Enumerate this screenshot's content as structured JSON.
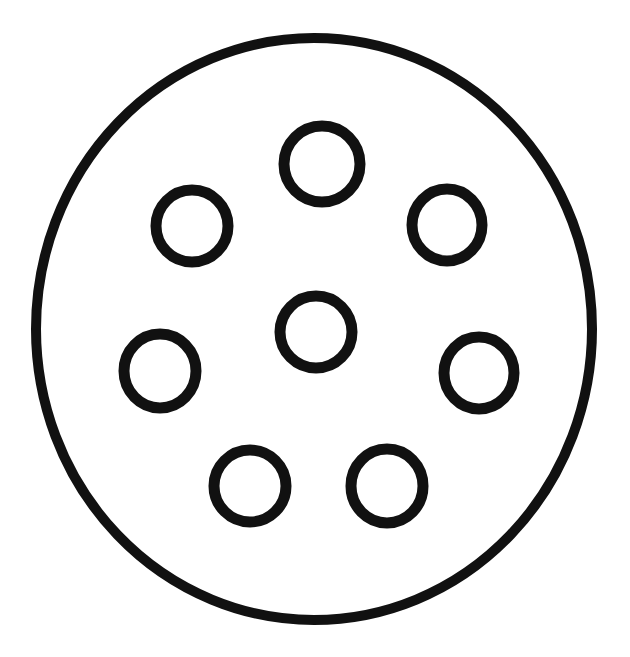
{
  "canvas": {
    "width": 630,
    "height": 657,
    "background_color": "#ffffff",
    "ink_color": "#111111"
  },
  "figure": {
    "name": "circular-plate-with-bolt-holes",
    "style": "hand-drawn ink outline, no fill, no labels, no dimensions, no text",
    "outer_boundary": {
      "name": "plate-outline",
      "shape": "circle",
      "center_x": 314,
      "center_y": 329,
      "radius_x": 278,
      "radius_y": 291,
      "stroke_width": 10,
      "fill": "none"
    },
    "holes": [
      {
        "name": "center-hole",
        "position": "center",
        "center_x": 316,
        "center_y": 332,
        "radius_x": 36,
        "radius_y": 36,
        "stroke_width": 11
      },
      {
        "name": "hole-top",
        "position": "top",
        "center_x": 322,
        "center_y": 164,
        "radius_x": 38,
        "radius_y": 38,
        "stroke_width": 11
      },
      {
        "name": "hole-upper-left",
        "position": "upper-left",
        "center_x": 192,
        "center_y": 226,
        "radius_x": 36,
        "radius_y": 36,
        "stroke_width": 11
      },
      {
        "name": "hole-upper-right",
        "position": "upper-right",
        "center_x": 447,
        "center_y": 225,
        "radius_x": 35,
        "radius_y": 36,
        "stroke_width": 11
      },
      {
        "name": "hole-middle-left",
        "position": "middle-left",
        "center_x": 160,
        "center_y": 371,
        "radius_x": 36,
        "radius_y": 37,
        "stroke_width": 11
      },
      {
        "name": "hole-middle-right",
        "position": "middle-right",
        "center_x": 479,
        "center_y": 373,
        "radius_x": 35,
        "radius_y": 36,
        "stroke_width": 11
      },
      {
        "name": "hole-bottom-left",
        "position": "bottom-left",
        "center_x": 250,
        "center_y": 486,
        "radius_x": 36,
        "radius_y": 36,
        "stroke_width": 11
      },
      {
        "name": "hole-bottom-right",
        "position": "bottom-right",
        "center_x": 387,
        "center_y": 486,
        "radius_x": 36,
        "radius_y": 37,
        "stroke_width": 11
      }
    ],
    "hole_count_total": 7,
    "hole_count_ring": 6,
    "hole_count_center": 1
  }
}
